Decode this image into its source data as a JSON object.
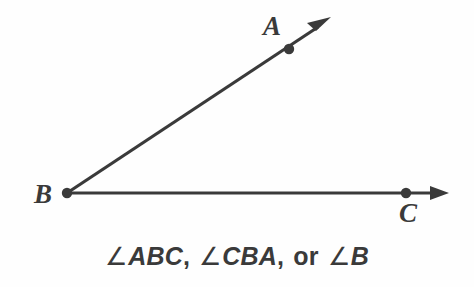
{
  "figure": {
    "type": "geometry-angle-diagram",
    "background_color": "#fefefe",
    "stroke_color": "#3a3a3a",
    "stroke_width": 3,
    "vertex": {
      "name": "B",
      "label": "B",
      "x": 67,
      "y": 193,
      "label_x": 43,
      "label_y": 203
    },
    "points": [
      {
        "name": "A",
        "label": "A",
        "x": 289,
        "y": 49,
        "label_x": 272,
        "label_y": 35
      },
      {
        "name": "C",
        "label": "C",
        "x": 406,
        "y": 193,
        "label_x": 408,
        "label_y": 222
      }
    ],
    "rays": [
      {
        "name": "ray-BA",
        "from_x": 67,
        "from_y": 193,
        "to_x": 328,
        "to_y": 20,
        "arrow": "end"
      },
      {
        "name": "ray-BC",
        "from_x": 67,
        "from_y": 193,
        "to_x": 447,
        "to_y": 193,
        "arrow": "end"
      }
    ]
  },
  "caption": {
    "full_text": "∠ABC, ∠CBA, or ∠B",
    "angle_symbol": "∠",
    "name_1": "ABC",
    "name_1_comma": ",",
    "name_2": "CBA",
    "name_2_comma": ",",
    "conjunction": "or",
    "name_3": "B"
  }
}
